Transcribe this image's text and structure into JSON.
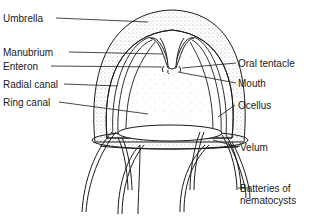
{
  "diagram": {
    "labels_left": [
      {
        "id": "umbrella",
        "text": "Umbrella"
      },
      {
        "id": "manubrium",
        "text": "Manubrium"
      },
      {
        "id": "enteron",
        "text": "Enteron"
      },
      {
        "id": "radial-canal",
        "text": "Radial canal"
      },
      {
        "id": "ring-canal",
        "text": "Ring canal"
      }
    ],
    "labels_right": [
      {
        "id": "oral-tentacle",
        "text": "Oral tentacle"
      },
      {
        "id": "mouth",
        "text": "Mouth"
      },
      {
        "id": "ocellus",
        "text": "Ocellus"
      },
      {
        "id": "velum",
        "text": "Velum"
      },
      {
        "id": "batteries-line1",
        "text": "Batteries of"
      },
      {
        "id": "batteries-line2",
        "text": "nematocysts"
      }
    ],
    "colors": {
      "ink": "#1a1a1a",
      "background": "#ffffff"
    }
  }
}
